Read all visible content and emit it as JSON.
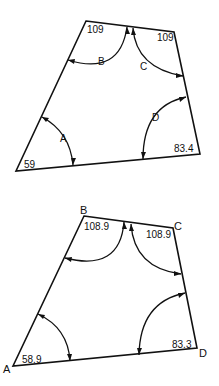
{
  "figures": [
    {
      "id": "top",
      "angles": [
        {
          "label": "A",
          "value": "59"
        },
        {
          "label": "B",
          "value": "109"
        },
        {
          "label": "C",
          "value": "109"
        },
        {
          "label": "D",
          "value": "83.4"
        }
      ]
    },
    {
      "id": "bottom",
      "vertices": [
        "A",
        "B",
        "C",
        "D"
      ],
      "angles": [
        {
          "label": "A",
          "value": "58.9"
        },
        {
          "label": "B",
          "value": "108.9"
        },
        {
          "label": "C",
          "value": "108.9"
        },
        {
          "label": "D",
          "value": "83.3"
        }
      ]
    }
  ],
  "colors": {
    "stroke": "#111111",
    "background": "#ffffff"
  }
}
